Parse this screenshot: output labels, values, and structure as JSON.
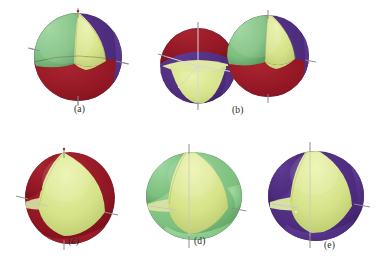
{
  "figure": {
    "background_color": "#ffffff",
    "panel_count": 5
  },
  "palette": {
    "green": "#7cbf7e",
    "green_dark": "#5f9e63",
    "green_light": "#9ad49a",
    "pale_yellow": "#d6e389",
    "pale_yellow_light": "#e4ef9f",
    "pale_yellow_dark": "#bccb72",
    "purple": "#4b2a7a",
    "purple_dark": "#3a1f60",
    "purple_light": "#5e3a92",
    "dark_red": "#8e1522",
    "dark_red_dark": "#6d0f1a",
    "dark_red_light": "#a82431",
    "axis": "#8d8d8d",
    "axis_light": "#c9c9c9",
    "caption_text": "#2a2a2a",
    "outline": "#6b6b6b"
  },
  "panels": [
    {
      "id": "a",
      "caption": "(a)",
      "description": "full sphere with four visible sectors",
      "colors": [
        "green",
        "pale_yellow",
        "purple",
        "dark_red"
      ],
      "axes_visible": true,
      "cut_open": false
    },
    {
      "id": "b",
      "caption": "(b)",
      "description": "two spheres: left cut-open showing interior axes, right full sphere",
      "colors": [
        "dark_red",
        "pale_yellow",
        "purple",
        "green"
      ],
      "axes_visible": true,
      "cut_open": true
    },
    {
      "id": "c",
      "caption": "(c)",
      "description": "dark red sphere opened to reveal pale yellow interior sector",
      "colors": [
        "dark_red",
        "pale_yellow"
      ],
      "axes_visible": true,
      "cut_open": true
    },
    {
      "id": "d",
      "caption": "(d)",
      "description": "green sphere opened to reveal pale yellow interior sector",
      "colors": [
        "green",
        "pale_yellow"
      ],
      "axes_visible": true,
      "cut_open": true
    },
    {
      "id": "e",
      "caption": "(e)",
      "description": "purple sphere opened to reveal pale yellow interior sector",
      "colors": [
        "purple",
        "pale_yellow"
      ],
      "axes_visible": true,
      "cut_open": true
    }
  ]
}
